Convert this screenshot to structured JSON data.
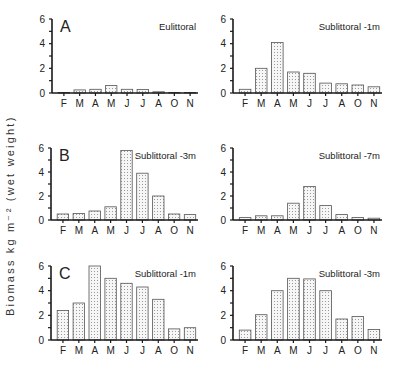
{
  "figure": {
    "ylabel": "Biomass kg m⁻² (wet weight)"
  },
  "chart_data": [
    {
      "type": "bar",
      "panel_letter": "A",
      "title": "Eulittoral",
      "categories": [
        "F",
        "M",
        "A",
        "M",
        "J",
        "J",
        "A",
        "O",
        "N"
      ],
      "values": [
        0.0,
        0.25,
        0.3,
        0.6,
        0.3,
        0.28,
        0.1,
        0.02,
        0.02
      ],
      "ylim": [
        0,
        6
      ],
      "yticks": [
        0,
        2,
        4,
        6
      ]
    },
    {
      "type": "bar",
      "panel_letter": "",
      "title": "Sublittoral -1m",
      "categories": [
        "F",
        "M",
        "A",
        "M",
        "J",
        "J",
        "A",
        "O",
        "N"
      ],
      "values": [
        0.3,
        2.0,
        4.1,
        1.7,
        1.6,
        0.8,
        0.75,
        0.65,
        0.5
      ],
      "ylim": [
        0,
        6
      ],
      "yticks": [
        0,
        2,
        4,
        6
      ]
    },
    {
      "type": "bar",
      "panel_letter": "B",
      "title": "Sublittoral -3m",
      "categories": [
        "F",
        "M",
        "A",
        "M",
        "J",
        "J",
        "A",
        "O",
        "N"
      ],
      "values": [
        0.5,
        0.55,
        0.75,
        1.1,
        5.8,
        3.9,
        2.0,
        0.5,
        0.45
      ],
      "ylim": [
        0,
        6
      ],
      "yticks": [
        0,
        2,
        4,
        6
      ]
    },
    {
      "type": "bar",
      "panel_letter": "",
      "title": "Sublittoral -7m",
      "categories": [
        "F",
        "M",
        "A",
        "M",
        "J",
        "J",
        "A",
        "O",
        "N"
      ],
      "values": [
        0.2,
        0.35,
        0.35,
        1.4,
        2.8,
        1.2,
        0.45,
        0.2,
        0.15
      ],
      "ylim": [
        0,
        6
      ],
      "yticks": [
        0,
        2,
        4,
        6
      ]
    },
    {
      "type": "bar",
      "panel_letter": "C",
      "title": "Sublittoral -1m",
      "categories": [
        "F",
        "M",
        "A",
        "M",
        "J",
        "J",
        "A",
        "O",
        "N"
      ],
      "values": [
        2.4,
        3.0,
        6.0,
        5.0,
        4.6,
        4.3,
        3.3,
        0.9,
        1.0
      ],
      "ylim": [
        0,
        6
      ],
      "yticks": [
        0,
        2,
        4,
        6
      ]
    },
    {
      "type": "bar",
      "panel_letter": "",
      "title": "Sublittoral -3m",
      "categories": [
        "F",
        "M",
        "A",
        "M",
        "J",
        "J",
        "A",
        "O",
        "N"
      ],
      "values": [
        0.8,
        2.05,
        4.0,
        5.0,
        4.95,
        4.0,
        1.7,
        1.9,
        0.85
      ],
      "ylim": [
        0,
        6
      ],
      "yticks": [
        0,
        2,
        4,
        6
      ]
    }
  ],
  "layout": {
    "panels": [
      {
        "axis_x": 52,
        "top_y": 19,
        "zero_y": 93,
        "right_x": 198
      },
      {
        "axis_x": 233,
        "top_y": 19,
        "zero_y": 93,
        "right_x": 382
      },
      {
        "axis_x": 51,
        "top_y": 148,
        "zero_y": 220,
        "right_x": 198
      },
      {
        "axis_x": 233,
        "top_y": 148,
        "zero_y": 220,
        "right_x": 382
      },
      {
        "axis_x": 51,
        "top_y": 266,
        "zero_y": 340,
        "right_x": 198
      },
      {
        "axis_x": 233,
        "top_y": 266,
        "zero_y": 340,
        "right_x": 382
      }
    ],
    "colors": {
      "axis": "#1a1a1a",
      "bar_stroke": "#555555",
      "bar_fill": "#f4f4f4",
      "dot": "#9a9a9a"
    }
  }
}
